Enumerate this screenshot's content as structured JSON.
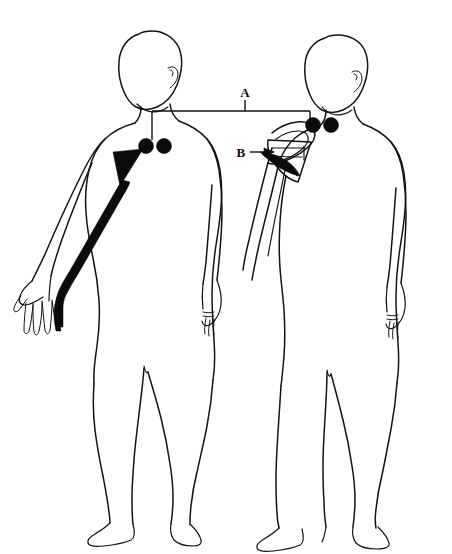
{
  "figure": {
    "background_color": "#ffffff",
    "ink_color": "#15120f",
    "marker_color": "#0d0b09",
    "width": 452,
    "height": 554
  },
  "labels": [
    {
      "id": "label-a",
      "text": "A",
      "description": "Bracket callout spanning between the electrode pair on the left figure and the electrode pair on the right figure",
      "x": 245,
      "y": 97,
      "leader_type": "bracket"
    },
    {
      "id": "label-b",
      "text": "B",
      "description": "Arrow callout pointing to the dark wedge structure inside the dissected shoulder of the right figure",
      "x": 241,
      "y": 155,
      "leader_type": "arrow"
    }
  ],
  "markers": {
    "left_figure_electrodes": [
      {
        "id": "left-electrode-1",
        "cx": 146,
        "cy": 146,
        "r": 7.5
      },
      {
        "id": "left-electrode-2",
        "cx": 164,
        "cy": 146,
        "r": 7.5
      }
    ],
    "right_figure_electrodes": [
      {
        "id": "right-electrode-1",
        "cx": 313,
        "cy": 125,
        "r": 7.5
      },
      {
        "id": "right-electrode-2",
        "cx": 331,
        "cy": 125,
        "r": 7.5
      }
    ]
  },
  "annotations": {
    "left_arm_pathway": "Thick dark band descending from a triangular origin marker at the left shoulder, along the posterior arm and forearm, terminating at the hand",
    "right_shoulder_dissection": "Cutaway flap at the right figure's shoulder exposing layered muscle with a dark wedge indicated by label B"
  },
  "figures": [
    {
      "id": "left-figure",
      "name": "left-body-figure",
      "view": "posterior",
      "pose": "left arm extended outward, right arm at side"
    },
    {
      "id": "right-figure",
      "name": "right-body-figure",
      "view": "posterior",
      "pose": "standing, shoulder dissected"
    }
  ]
}
